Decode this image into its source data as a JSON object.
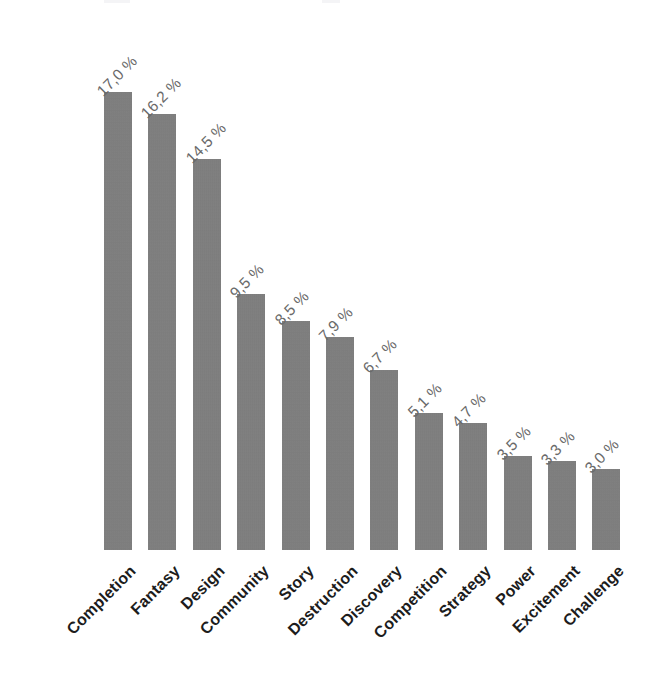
{
  "chart_data": {
    "type": "bar",
    "title": "",
    "subtitle": "",
    "xlabel": "",
    "ylabel": "",
    "unit": "%",
    "decimal_separator": ",",
    "categories": [
      "Completion",
      "Fantasy",
      "Design",
      "Community",
      "Story",
      "Destruction",
      "Discovery",
      "Competition",
      "Strategy",
      "Power",
      "Excitement",
      "Challenge"
    ],
    "values": [
      17.0,
      16.2,
      14.5,
      9.5,
      8.5,
      7.9,
      6.7,
      5.1,
      4.7,
      3.5,
      3.3,
      3.0
    ],
    "value_labels": [
      "17,0 %",
      "16,2 %",
      "14,5 %",
      "9,5 %",
      "8,5 %",
      "7,9 %",
      "6,7 %",
      "5,1 %",
      "4,7 %",
      "3,5 %",
      "3,3 %",
      "3,0 %"
    ],
    "ylim": [
      0,
      17.0
    ],
    "grid": false,
    "legend": false,
    "legend_position": "none",
    "axis_lines": false,
    "tick_labels_y": [],
    "data_labels_rotation_deg": -45,
    "category_labels_rotation_deg": -45
  },
  "style": {
    "bar_color": "#7e7e7e",
    "background_color": "#ffffff",
    "value_label_color": "#6a6a6a",
    "category_label_color": "#1c1c1c"
  }
}
